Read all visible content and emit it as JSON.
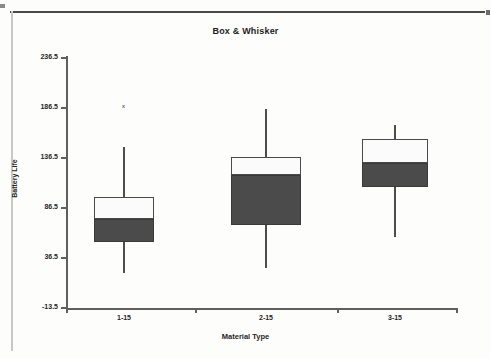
{
  "page": {
    "background_color": "#fdfdfc",
    "rule_color": "#4a4a4a"
  },
  "chart_data": {
    "type": "box",
    "title": "Box & Whisker",
    "xlabel": "Material Type",
    "ylabel": "Battery Life",
    "categories": [
      "1-15",
      "2-15",
      "3-15"
    ],
    "ylim": [
      -13.5,
      236.5
    ],
    "ytick_labels": [
      "236.5",
      "186.5",
      "136.5",
      "86.5",
      "36.5",
      "-13.5"
    ],
    "ytick_values": [
      236.5,
      186.5,
      136.5,
      86.5,
      36.5,
      -13.5
    ],
    "grid": false,
    "legend": "none",
    "box_fill_upper": "#fbfbfb",
    "box_fill_lower": "#4b4b4b",
    "line_color": "#4d4d4d",
    "boxes": [
      {
        "category": "1-15",
        "whisker_low": 22,
        "q1": 53,
        "median": 76,
        "q3": 98,
        "whisker_high": 148,
        "outliers": [
          189
        ],
        "outlier_marker": "x"
      },
      {
        "category": "2-15",
        "whisker_low": 27,
        "q1": 70,
        "median": 120,
        "q3": 138,
        "whisker_high": 186,
        "outliers": [],
        "outlier_marker": "x"
      },
      {
        "category": "3-15",
        "whisker_low": 58,
        "q1": 108,
        "median": 132,
        "q3": 156,
        "whisker_high": 170,
        "outliers": [],
        "outlier_marker": "x"
      }
    ]
  }
}
